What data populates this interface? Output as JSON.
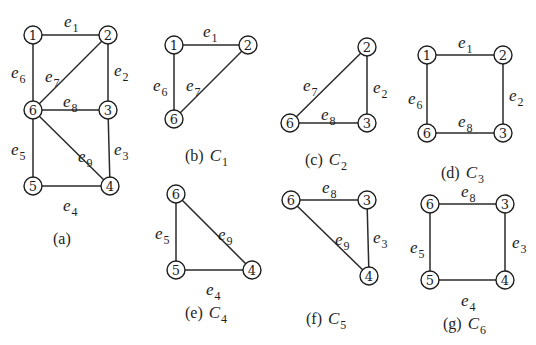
{
  "figure": {
    "background": "#ffffff",
    "stroke_color": "#1e1e1e",
    "node_radius": 9
  },
  "subfigures": [
    {
      "id": "a",
      "caption": {
        "label": "(a)",
        "cycle": "",
        "sub": "",
        "x": 53,
        "y": 244
      },
      "nodes": [
        {
          "id": "1",
          "x": 33,
          "y": 35
        },
        {
          "id": "2",
          "x": 108,
          "y": 35
        },
        {
          "id": "6",
          "x": 33,
          "y": 110
        },
        {
          "id": "3",
          "x": 108,
          "y": 110
        },
        {
          "id": "5",
          "x": 33,
          "y": 186
        },
        {
          "id": "4",
          "x": 110,
          "y": 186
        }
      ],
      "edges": [
        {
          "name": "e",
          "sub": "1",
          "from": "1",
          "to": "2",
          "lx": 64,
          "ly": 27
        },
        {
          "name": "e",
          "sub": "2",
          "from": "2",
          "to": "3",
          "lx": 114,
          "ly": 76
        },
        {
          "name": "e",
          "sub": "3",
          "from": "3",
          "to": "4",
          "lx": 114,
          "ly": 155
        },
        {
          "name": "e",
          "sub": "4",
          "from": "5",
          "to": "4",
          "lx": 63,
          "ly": 211
        },
        {
          "name": "e",
          "sub": "5",
          "from": "6",
          "to": "5",
          "lx": 11,
          "ly": 155
        },
        {
          "name": "e",
          "sub": "6",
          "from": "1",
          "to": "6",
          "lx": 11,
          "ly": 78
        },
        {
          "name": "e",
          "sub": "7",
          "from": "2",
          "to": "6",
          "lx": 45,
          "ly": 82
        },
        {
          "name": "e",
          "sub": "8",
          "from": "6",
          "to": "3",
          "lx": 63,
          "ly": 107
        },
        {
          "name": "e",
          "sub": "9",
          "from": "6",
          "to": "4",
          "lx": 78,
          "ly": 162
        }
      ]
    },
    {
      "id": "b",
      "caption": {
        "label": "(b)",
        "cycle": "C",
        "sub": "1",
        "x": 185,
        "y": 161
      },
      "nodes": [
        {
          "id": "1",
          "x": 174,
          "y": 45
        },
        {
          "id": "2",
          "x": 248,
          "y": 45
        },
        {
          "id": "6",
          "x": 174,
          "y": 119
        }
      ],
      "edges": [
        {
          "name": "e",
          "sub": "1",
          "from": "1",
          "to": "2",
          "lx": 203,
          "ly": 37
        },
        {
          "name": "e",
          "sub": "6",
          "from": "1",
          "to": "6",
          "lx": 153,
          "ly": 91
        },
        {
          "name": "e",
          "sub": "7",
          "from": "2",
          "to": "6",
          "lx": 186,
          "ly": 91
        }
      ]
    },
    {
      "id": "c",
      "caption": {
        "label": "(c)",
        "cycle": "C",
        "sub": "2",
        "x": 305,
        "y": 165
      },
      "nodes": [
        {
          "id": "2",
          "x": 367,
          "y": 47
        },
        {
          "id": "6",
          "x": 290,
          "y": 123
        },
        {
          "id": "3",
          "x": 367,
          "y": 123
        }
      ],
      "edges": [
        {
          "name": "e",
          "sub": "2",
          "from": "2",
          "to": "3",
          "lx": 373,
          "ly": 93
        },
        {
          "name": "e",
          "sub": "7",
          "from": "2",
          "to": "6",
          "lx": 303,
          "ly": 91
        },
        {
          "name": "e",
          "sub": "8",
          "from": "6",
          "to": "3",
          "lx": 321,
          "ly": 120
        }
      ]
    },
    {
      "id": "d",
      "caption": {
        "label": "(d)",
        "cycle": "C",
        "sub": "3",
        "x": 441,
        "y": 178
      },
      "nodes": [
        {
          "id": "1",
          "x": 427,
          "y": 55
        },
        {
          "id": "2",
          "x": 503,
          "y": 55
        },
        {
          "id": "6",
          "x": 427,
          "y": 133
        },
        {
          "id": "3",
          "x": 503,
          "y": 133
        }
      ],
      "edges": [
        {
          "name": "e",
          "sub": "1",
          "from": "1",
          "to": "2",
          "lx": 458,
          "ly": 48
        },
        {
          "name": "e",
          "sub": "2",
          "from": "2",
          "to": "3",
          "lx": 509,
          "ly": 101
        },
        {
          "name": "e",
          "sub": "6",
          "from": "1",
          "to": "6",
          "lx": 408,
          "ly": 104
        },
        {
          "name": "e",
          "sub": "8",
          "from": "6",
          "to": "3",
          "lx": 458,
          "ly": 127
        }
      ]
    },
    {
      "id": "e",
      "caption": {
        "label": "(e)",
        "cycle": "C",
        "sub": "4",
        "x": 185,
        "y": 318
      },
      "nodes": [
        {
          "id": "6",
          "x": 176,
          "y": 194
        },
        {
          "id": "5",
          "x": 176,
          "y": 270
        },
        {
          "id": "4",
          "x": 252,
          "y": 270
        }
      ],
      "edges": [
        {
          "name": "e",
          "sub": "5",
          "from": "6",
          "to": "5",
          "lx": 155,
          "ly": 239
        },
        {
          "name": "e",
          "sub": "9",
          "from": "6",
          "to": "4",
          "lx": 218,
          "ly": 240
        },
        {
          "name": "e",
          "sub": "4",
          "from": "5",
          "to": "4",
          "lx": 206,
          "ly": 295
        }
      ]
    },
    {
      "id": "f",
      "caption": {
        "label": "(f)",
        "cycle": "C",
        "sub": "5",
        "x": 306,
        "y": 324
      },
      "nodes": [
        {
          "id": "6",
          "x": 291,
          "y": 200
        },
        {
          "id": "3",
          "x": 367,
          "y": 200
        },
        {
          "id": "4",
          "x": 369,
          "y": 276
        }
      ],
      "edges": [
        {
          "name": "e",
          "sub": "8",
          "from": "6",
          "to": "3",
          "lx": 322,
          "ly": 193
        },
        {
          "name": "e",
          "sub": "3",
          "from": "3",
          "to": "4",
          "lx": 373,
          "ly": 243
        },
        {
          "name": "e",
          "sub": "9",
          "from": "6",
          "to": "4",
          "lx": 335,
          "ly": 245
        }
      ]
    },
    {
      "id": "g",
      "caption": {
        "label": "(g)",
        "cycle": "C",
        "sub": "6",
        "x": 443,
        "y": 329
      },
      "nodes": [
        {
          "id": "6",
          "x": 430,
          "y": 204
        },
        {
          "id": "3",
          "x": 505,
          "y": 204
        },
        {
          "id": "5",
          "x": 430,
          "y": 280
        },
        {
          "id": "4",
          "x": 505,
          "y": 280
        }
      ],
      "edges": [
        {
          "name": "e",
          "sub": "8",
          "from": "6",
          "to": "3",
          "lx": 461,
          "ly": 197
        },
        {
          "name": "e",
          "sub": "3",
          "from": "3",
          "to": "4",
          "lx": 512,
          "ly": 248
        },
        {
          "name": "e",
          "sub": "5",
          "from": "6",
          "to": "5",
          "lx": 410,
          "ly": 253
        },
        {
          "name": "e",
          "sub": "4",
          "from": "5",
          "to": "4",
          "lx": 461,
          "ly": 306
        }
      ]
    }
  ]
}
